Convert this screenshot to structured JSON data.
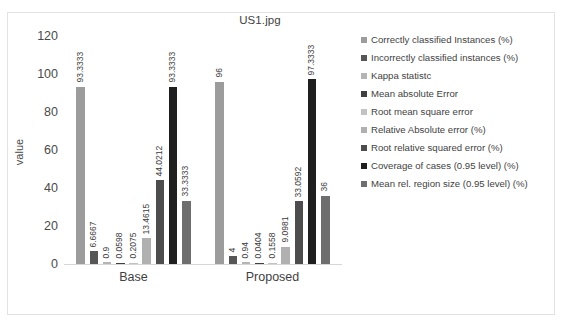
{
  "chart_data": {
    "type": "bar",
    "title": "US1.jpg",
    "xlabel": "",
    "ylabel": "value",
    "categories": [
      "Base",
      "Proposed"
    ],
    "ylim": [
      0,
      120
    ],
    "yticks": [
      120,
      100,
      80,
      60,
      40,
      20,
      0
    ],
    "grid": false,
    "legend_position": "right",
    "series": [
      {
        "name": "Correctly classified Instances (%)",
        "color": "#9c9c9c",
        "values": [
          93.3333,
          96
        ],
        "labels": [
          "93.3333",
          "96"
        ]
      },
      {
        "name": "Incorrectly classified instances (%)",
        "color": "#565656",
        "values": [
          6.6667,
          4
        ],
        "labels": [
          "6.6667",
          "4"
        ]
      },
      {
        "name": "Kappa statistc",
        "color": "#b5b5b5",
        "values": [
          0.9,
          0.94
        ],
        "labels": [
          "0.9",
          "0.94"
        ]
      },
      {
        "name": "Mean absolute Error",
        "color": "#404040",
        "values": [
          0.0598,
          0.0404
        ],
        "labels": [
          "0.0598",
          "0.0404"
        ]
      },
      {
        "name": "Root mean square error",
        "color": "#c2c2c2",
        "values": [
          0.2075,
          0.1558
        ],
        "labels": [
          "0.2075",
          "0.1558"
        ]
      },
      {
        "name": "Relative Absolute error (%)",
        "color": "#b0b0b0",
        "values": [
          13.4615,
          9.0981
        ],
        "labels": [
          "13.4615",
          "9.0981"
        ]
      },
      {
        "name": "Root relative squared error (%)",
        "color": "#4d4d4d",
        "values": [
          44.0212,
          33.0592
        ],
        "labels": [
          "44.0212",
          "33.0592"
        ]
      },
      {
        "name": "Coverage of cases (0.95 level) (%)",
        "color": "#1f1f1f",
        "values": [
          93.3333,
          97.3333
        ],
        "labels": [
          "93.3333",
          "97.3333"
        ]
      },
      {
        "name": "Mean rel. region size (0.95 level) (%)",
        "color": "#6e6e6e",
        "values": [
          33.3333,
          36
        ],
        "labels": [
          "33.3333",
          "36"
        ]
      }
    ]
  },
  "colors": {
    "frame_border": "#e2e2e2",
    "axis_line": "#d6d6d6",
    "text": "#3f3f3f",
    "background": "#ffffff"
  }
}
